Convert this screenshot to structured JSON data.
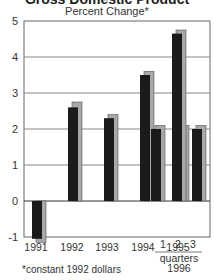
{
  "chart_data": {
    "type": "bar",
    "title": "Gross Domestic Product",
    "subtitle": "Percent Change*",
    "footnote": "*constant 1992 dollars",
    "categories": [
      "1991",
      "1992",
      "1993",
      "1994",
      "1995",
      "1996 Q1",
      "1996 Q2",
      "1996 Q3"
    ],
    "x_tick_labels": [
      "1991",
      "1992",
      "1993",
      "1994",
      "1995",
      "1",
      "2",
      "3"
    ],
    "x_group_label": "quarters\n1996",
    "series": [
      {
        "name": "black",
        "color": "#1a1a1a",
        "values": [
          -1.05,
          2.6,
          2.3,
          3.5,
          2.0,
          2.0,
          4.65,
          2.0
        ]
      },
      {
        "name": "gray",
        "color": "#a8a8a8",
        "values": [
          -1.15,
          2.75,
          2.4,
          3.6,
          2.1,
          2.1,
          4.75,
          2.1
        ]
      }
    ],
    "ylim": [
      -1,
      5
    ],
    "yticks": [
      -1,
      0,
      1,
      2,
      3,
      4,
      5
    ],
    "grid": true,
    "legend": "none"
  },
  "labels": {
    "title": "Gross Domestic Product",
    "subtitle": "Percent Change*",
    "quarters": "quarters",
    "year": "1996",
    "footnote": "*constant 1992 dollars"
  }
}
